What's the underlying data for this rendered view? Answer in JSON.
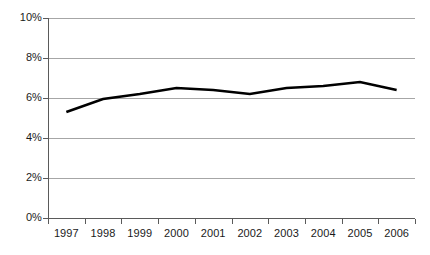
{
  "chart_data": {
    "type": "line",
    "title": "",
    "subtitle": "",
    "xlabel": "",
    "ylabel": "",
    "categories": [
      "1997",
      "1998",
      "1999",
      "2000",
      "2001",
      "2002",
      "2003",
      "2004",
      "2005",
      "2006"
    ],
    "values": [
      5.3,
      5.95,
      6.2,
      6.5,
      6.4,
      6.2,
      6.5,
      6.6,
      6.8,
      6.4
    ],
    "series": [
      {
        "name": "",
        "values": [
          5.3,
          5.95,
          6.2,
          6.5,
          6.4,
          6.2,
          6.5,
          6.6,
          6.8,
          6.4
        ]
      }
    ],
    "ylim": [
      0,
      10
    ],
    "ytick_values": [
      0,
      2,
      4,
      6,
      8,
      10
    ],
    "ytick_labels": [
      "0%",
      "2%",
      "4%",
      "6%",
      "8%",
      "10%"
    ],
    "xtick_labels": [
      "1997",
      "1998",
      "1999",
      "2000",
      "2001",
      "2002",
      "2003",
      "2004",
      "2005",
      "2006"
    ],
    "grid": true,
    "grid_axis": "y",
    "legend": false,
    "legend_position": "none",
    "markers": false,
    "annotations": [],
    "colors": {
      "series_line": "#000000",
      "gridline": "#a6a6a6",
      "axis": "#5a5a5a",
      "text": "#1a1a1a",
      "background": "#ffffff"
    }
  }
}
